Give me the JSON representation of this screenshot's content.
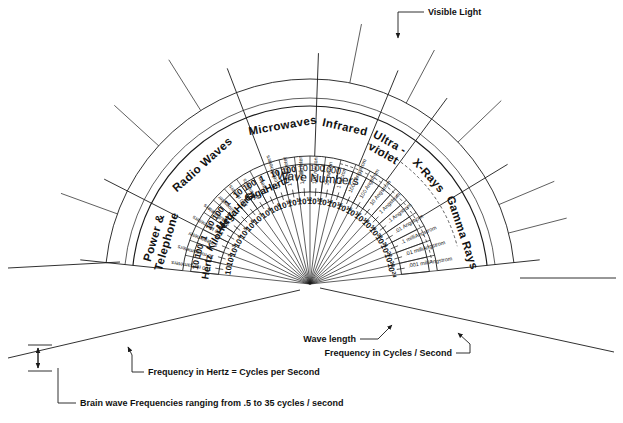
{
  "geometry": {
    "center_x": 310,
    "center_y": 284,
    "angle_start_deg": 186,
    "angle_end_deg": 354,
    "radii": {
      "r_freq_tick": 92,
      "r_unit_in": 92,
      "r_unit_out": 120,
      "r_band_in": 128,
      "r_band_out": 178,
      "r_outer": 205,
      "r_dash_in": 150,
      "r_wl_in": 96,
      "r_wl_out": 186
    }
  },
  "bands": [
    {
      "name": "band-power-telephone",
      "label": "Power &\nTelephone",
      "line1": "Power &",
      "line2": "Telephone"
    },
    {
      "name": "band-radio-waves",
      "label": "Radio Waves",
      "line1": "Radio Waves",
      "line2": ""
    },
    {
      "name": "band-microwaves",
      "label": "Microwaves",
      "line1": "Microwaves",
      "line2": ""
    },
    {
      "name": "band-infrared",
      "label": "Infrared",
      "line1": "Infrared",
      "line2": ""
    },
    {
      "name": "band-ultraviolet",
      "label": "Ultra-violet",
      "line1": "Ultra -",
      "line2": "violet"
    },
    {
      "name": "band-xrays",
      "label": "X-Rays",
      "line1": "X-Rays",
      "line2": ""
    },
    {
      "name": "band-gamma-rays",
      "label": "Gamma Rays",
      "line1": "Gamma Rays",
      "line2": ""
    }
  ],
  "frequency_units": [
    {
      "name": "Hertz",
      "values": [
        "10",
        "100",
        "1"
      ]
    },
    {
      "name": "KiloHertz",
      "values": [
        "10",
        "100"
      ]
    },
    {
      "name": "MegaHertz",
      "values": [
        "1",
        "10",
        "100"
      ]
    },
    {
      "name": "GigaHertz",
      "values": [
        "1",
        "10",
        "100"
      ]
    }
  ],
  "wave_numbers": {
    "title": "Wave Numbers",
    "values": [
      "10",
      "100",
      "1000"
    ]
  },
  "spokes": [
    {
      "exponent": "10",
      "sup": "",
      "wavelength": "100 megameters"
    },
    {
      "exponent": "10",
      "sup": "2",
      "wavelength": "10 megameters"
    },
    {
      "exponent": "10",
      "sup": "3",
      "wavelength": "1 megameter"
    },
    {
      "exponent": "10",
      "sup": "4",
      "wavelength": "100 kilometers"
    },
    {
      "exponent": "10",
      "sup": "5",
      "wavelength": "10 kilometers"
    },
    {
      "exponent": "10",
      "sup": "6",
      "wavelength": "1 kilometer"
    },
    {
      "exponent": "10",
      "sup": "7",
      "wavelength": "100 meters"
    },
    {
      "exponent": "10",
      "sup": "8",
      "wavelength": "10 meters"
    },
    {
      "exponent": "10",
      "sup": "9",
      "wavelength": "1 meter"
    },
    {
      "exponent": "10",
      "sup": "10",
      "wavelength": "10 centimeters"
    },
    {
      "exponent": "10",
      "sup": "11",
      "wavelength": "1 centimeter"
    },
    {
      "exponent": "10",
      "sup": "12",
      "wavelength": "1 millimeter"
    },
    {
      "exponent": "10",
      "sup": "13",
      "wavelength": "100 micron"
    },
    {
      "exponent": "10",
      "sup": "14",
      "wavelength": "10 micron"
    },
    {
      "exponent": "10",
      "sup": "15",
      "wavelength": "1 micron"
    },
    {
      "exponent": "10",
      "sup": "16",
      "wavelength": "1000 Angstrom"
    },
    {
      "exponent": "10",
      "sup": "17",
      "wavelength": "100 Angstrom"
    },
    {
      "exponent": "10",
      "sup": "18",
      "wavelength": "10 Angstrom"
    },
    {
      "exponent": "10",
      "sup": "19",
      "wavelength": "1 Angstrom"
    },
    {
      "exponent": "10",
      "sup": "20",
      "wavelength": ".1 Angstrom"
    },
    {
      "exponent": "10",
      "sup": "21",
      "wavelength": ".01 Angstrom"
    },
    {
      "exponent": "10",
      "sup": "22",
      "wavelength": ".1 milliAngstrom"
    },
    {
      "exponent": "10",
      "sup": "23",
      "wavelength": ".01 milliAngstrom"
    },
    {
      "exponent": "10",
      "sup": "24",
      "wavelength": ".001 milliAngstrom"
    }
  ],
  "annotations": {
    "visible_light": "Visible Light",
    "wave_length": "Wave length",
    "frequency_cycles": "Frequency in Cycles / Second",
    "frequency_hertz": "Frequency in Hertz = Cycles per Second",
    "brain_wave": "Brain wave Frequencies ranging from .5 to 35 cycles / second"
  },
  "colors": {
    "ink": "#1a1a1a",
    "paper": "#ffffff"
  }
}
